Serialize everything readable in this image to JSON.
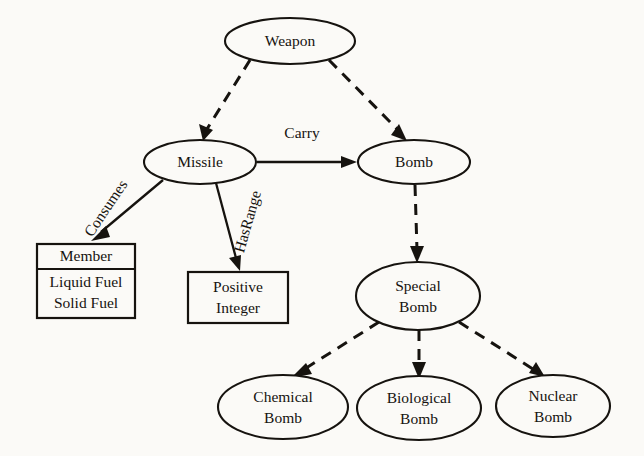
{
  "diagram": {
    "background_color": "#fbfaf7",
    "line_color": "#16130f",
    "nodes": [
      {
        "id": "weapon",
        "label": "Weapon",
        "shape": "ellipse",
        "cx": 290,
        "cy": 41,
        "rx": 65,
        "ry": 23
      },
      {
        "id": "missile",
        "label": "Missile",
        "shape": "ellipse",
        "cx": 200,
        "cy": 162,
        "rx": 56,
        "ry": 22
      },
      {
        "id": "bomb",
        "label": "Bomb",
        "shape": "ellipse",
        "cx": 414,
        "cy": 162,
        "rx": 56,
        "ry": 22
      },
      {
        "id": "special_bomb",
        "label_line1": "Special",
        "label_line2": "Bomb",
        "shape": "ellipse",
        "cx": 418,
        "cy": 296,
        "rx": 62,
        "ry": 34
      },
      {
        "id": "chemical_bomb",
        "label_line1": "Chemical",
        "label_line2": "Bomb",
        "shape": "ellipse",
        "cx": 283,
        "cy": 407,
        "rx": 65,
        "ry": 32
      },
      {
        "id": "biological_bomb",
        "label_line1": "Biological",
        "label_line2": "Bomb",
        "shape": "ellipse",
        "cx": 419,
        "cy": 408,
        "rx": 62,
        "ry": 32
      },
      {
        "id": "nuclear_bomb",
        "label_line1": "Nuclear",
        "label_line2": "Bomb",
        "shape": "ellipse",
        "cx": 553,
        "cy": 406,
        "rx": 57,
        "ry": 31
      }
    ],
    "boxes": [
      {
        "id": "member_box",
        "header": "Member",
        "rows": [
          "Liquid Fuel",
          "Solid Fuel"
        ],
        "x": 37,
        "y": 244,
        "width": 98,
        "height": 74,
        "divider_y": 269
      },
      {
        "id": "positive_integer_box",
        "header": null,
        "rows": [
          "Positive",
          "Integer"
        ],
        "x": 188,
        "y": 272,
        "width": 100,
        "height": 51,
        "divider_y": null
      }
    ],
    "edges": [
      {
        "id": "weapon-missile",
        "from": "weapon",
        "to": "missile",
        "style": "dashed",
        "label": null
      },
      {
        "id": "weapon-bomb",
        "from": "weapon",
        "to": "bomb",
        "style": "dashed",
        "label": null
      },
      {
        "id": "missile-bomb",
        "from": "missile",
        "to": "bomb",
        "style": "solid",
        "label": "Carry",
        "label_rotation": 0
      },
      {
        "id": "missile-member",
        "from": "missile",
        "to": "member_box",
        "style": "solid",
        "label": "Consumes",
        "label_rotation": -56
      },
      {
        "id": "missile-positive",
        "from": "missile",
        "to": "positive_integer_box",
        "style": "solid",
        "label": "HasRange",
        "label_rotation": -74
      },
      {
        "id": "bomb-special",
        "from": "bomb",
        "to": "special_bomb",
        "style": "dashed",
        "label": null
      },
      {
        "id": "special-chemical",
        "from": "special_bomb",
        "to": "chemical_bomb",
        "style": "dashed",
        "label": null
      },
      {
        "id": "special-biological",
        "from": "special_bomb",
        "to": "biological_bomb",
        "style": "dashed",
        "label": null
      },
      {
        "id": "special-nuclear",
        "from": "special_bomb",
        "to": "nuclear_bomb",
        "style": "dashed",
        "label": null
      }
    ]
  }
}
